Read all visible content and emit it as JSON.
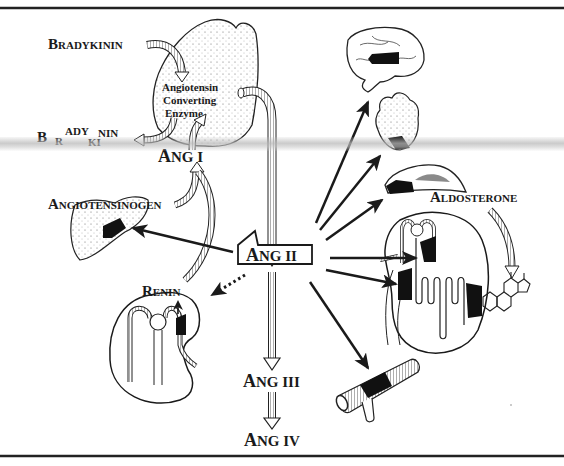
{
  "figure": {
    "labels": {
      "bradykinin_top": {
        "initial": "B",
        "rest": "RADYKININ"
      },
      "bradykinin_split": {
        "b1": "B",
        "r": "R",
        "ady": "ADY",
        "ki": "KI",
        "nin": "NIN"
      },
      "ace_line1": "Angiotensin",
      "ace_line2": "Converting",
      "ace_line3": "Enzyme",
      "ang1": {
        "initial": "A",
        "rest": "NG I"
      },
      "angiotensinogen": {
        "initial": "A",
        "rest": "NGIOTENSINOGEN"
      },
      "ang2": {
        "initial": "A",
        "rest": "NG II"
      },
      "renin": {
        "initial": "R",
        "rest": "ENIN"
      },
      "aldosterone": {
        "initial": "A",
        "rest": "LDOSTERONE"
      },
      "ang3": {
        "initial": "A",
        "rest": "NG III"
      },
      "ang4": {
        "initial": "A",
        "rest": "NG IV"
      }
    },
    "organs": [
      "lung",
      "liver",
      "kidney-renin",
      "brain",
      "heart",
      "adrenal-gland",
      "kidney-nephron",
      "blood-vessel"
    ],
    "colors": {
      "ink": "#1a1a1a",
      "background": "#ffffff",
      "scan_band": "#bdbdbd",
      "adrenal_shade": "#8a8a8a"
    }
  }
}
